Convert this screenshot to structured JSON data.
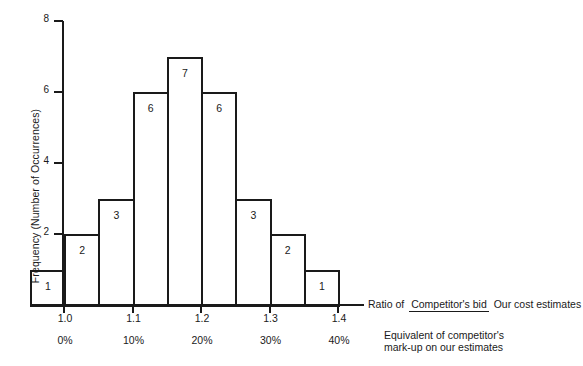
{
  "chart_data": {
    "type": "bar",
    "title": "",
    "xlabel": "Ratio of Competitor's bid / Our cost estimates",
    "ylabel": "Frequency (Number of Occurrences)",
    "categories": [
      "0.95-1.00",
      "1.00-1.05",
      "1.05-1.10",
      "1.10-1.15",
      "1.15-1.20",
      "1.20-1.25",
      "1.25-1.30",
      "1.30-1.35",
      "1.35-1.40"
    ],
    "bin_edges": [
      0.95,
      1.0,
      1.05,
      1.1,
      1.15,
      1.2,
      1.25,
      1.3,
      1.35,
      1.4
    ],
    "values": [
      1,
      2,
      3,
      6,
      7,
      6,
      3,
      2,
      1
    ],
    "xlim": [
      0.95,
      1.4
    ],
    "ylim": [
      0,
      8
    ],
    "grid": false,
    "legend": null
  },
  "axes": {
    "y_ticks": [
      {
        "value": 8,
        "label": "8"
      },
      {
        "value": 6,
        "label": "6"
      },
      {
        "value": 4,
        "label": "4"
      },
      {
        "value": 2,
        "label": "2"
      }
    ],
    "x_ticks": [
      {
        "value": 1.0,
        "label": "1.0",
        "percent": "0%"
      },
      {
        "value": 1.1,
        "label": "1.1",
        "percent": "10%"
      },
      {
        "value": 1.2,
        "label": "1.2",
        "percent": "20%"
      },
      {
        "value": 1.3,
        "label": "1.3",
        "percent": "30%"
      },
      {
        "value": 1.4,
        "label": "1.4",
        "percent": "40%"
      }
    ],
    "y_axis_title": "Frequency (Number of Occurrences)"
  },
  "annotations": {
    "ratio_lead": "Ratio of",
    "ratio_numerator": "Competitor's bid",
    "ratio_denominator": "Our cost estimates",
    "markup_line1": "Equivalent of competitor's",
    "markup_line2": "mark-up on our estimates"
  },
  "style": {
    "ink": "#1a1a1a",
    "background": "#ffffff"
  }
}
